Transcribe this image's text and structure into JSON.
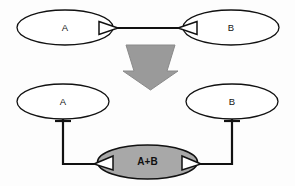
{
  "diagram": {
    "title": "",
    "background_color": "#fdfdfd",
    "stroke_color": "#111111",
    "fill_white": "#ffffff",
    "fill_gray": "#a8a8a8",
    "arrow_gray": "#9a9a9a",
    "arrow_gray_edge": "#7d7d7d",
    "top_row": {
      "left_node": {
        "label": "A",
        "shape": "ellipse",
        "fill": "#ffffff"
      },
      "right_node": {
        "label": "B",
        "shape": "ellipse",
        "fill": "#ffffff"
      },
      "connector": {
        "kind": "line",
        "left_marker": "hollow-triangle-right",
        "right_marker": "hollow-triangle-left"
      }
    },
    "transform_arrow": {
      "direction": "down",
      "fill": "#9a9a9a",
      "icon": "down-block-arrow-icon"
    },
    "bottom_row": {
      "left_node": {
        "label": "A",
        "shape": "ellipse",
        "fill": "#ffffff"
      },
      "right_node": {
        "label": "B",
        "shape": "ellipse",
        "fill": "#ffffff"
      },
      "left_stem": {
        "marker": "crossbar-tick"
      },
      "right_stem": {
        "marker": "crossbar-tick"
      }
    },
    "merged_node": {
      "label": "A+B",
      "shape": "ellipse",
      "fill": "#a8a8a8",
      "left_marker": "hollow-triangle-left",
      "right_marker": "hollow-triangle-right"
    }
  }
}
